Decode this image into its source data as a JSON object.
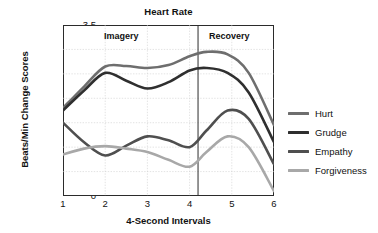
{
  "chart_data": {
    "type": "line",
    "title": "Heart Rate",
    "xlabel": "4-Second Intervals",
    "ylabel": "Beats/Min Change Scores",
    "xlim": [
      1,
      6
    ],
    "ylim": [
      0,
      3.5
    ],
    "grid": true,
    "legend_position": "right",
    "x_ticks": [
      "1",
      "2",
      "3",
      "4",
      "5",
      "6"
    ],
    "y_ticks": [
      "0",
      "0.5",
      "1",
      "1.5",
      "2",
      "2.5",
      "3",
      "3.5"
    ],
    "phase_divider_x": 4.2,
    "annotations": [
      {
        "text": "Imagery",
        "x": 2.0
      },
      {
        "text": "Recovery",
        "x": 5.1
      }
    ],
    "x": [
      1,
      1.5,
      2,
      2.5,
      3,
      3.5,
      4,
      4.4,
      4.9,
      5.4,
      6
    ],
    "series": [
      {
        "name": "Hurt",
        "color": "#6e6e6e",
        "values": [
          1.8,
          2.24,
          2.65,
          2.66,
          2.62,
          2.68,
          2.86,
          2.95,
          2.9,
          2.52,
          1.45
        ]
      },
      {
        "name": "Grudge",
        "color": "#2f2f2f",
        "values": [
          1.75,
          2.16,
          2.52,
          2.36,
          2.2,
          2.33,
          2.57,
          2.62,
          2.52,
          2.12,
          1.1
        ]
      },
      {
        "name": "Empathy",
        "color": "#4f4f4f",
        "values": [
          1.5,
          1.1,
          0.83,
          1.03,
          1.22,
          1.14,
          1.0,
          1.34,
          1.75,
          1.58,
          0.65
        ]
      },
      {
        "name": "Forgiveness",
        "color": "#a8a8a8",
        "values": [
          0.85,
          0.97,
          1.02,
          0.97,
          0.9,
          0.74,
          0.6,
          0.9,
          1.22,
          1.0,
          0.1
        ]
      }
    ]
  },
  "legend": {
    "items": [
      {
        "label": "Hurt",
        "color": "#6e6e6e"
      },
      {
        "label": "Grudge",
        "color": "#2f2f2f"
      },
      {
        "label": "Empathy",
        "color": "#4f4f4f"
      },
      {
        "label": "Forgiveness",
        "color": "#a8a8a8"
      }
    ]
  }
}
